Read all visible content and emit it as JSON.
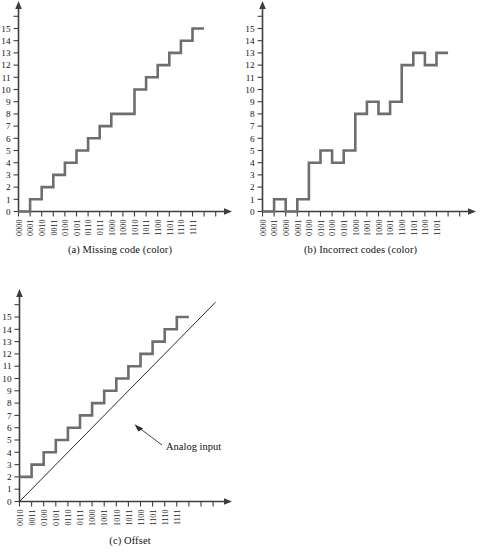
{
  "figure": {
    "title_visible": false,
    "background_color": "#ffffff",
    "stair_color": "#6e6e6e",
    "axis_color": "#3d3d3d",
    "ideal_line_color": "#2b2b2b"
  },
  "panels": [
    {
      "id": "a",
      "caption": "(a) Missing code (color)",
      "y_ticks": [
        "0",
        "1",
        "2",
        "3",
        "4",
        "5",
        "6",
        "7",
        "8",
        "9",
        "10",
        "11",
        "12",
        "13",
        "14",
        "15"
      ],
      "x_ticks": [
        "0000",
        "0001",
        "0010",
        "0011",
        "0100",
        "0101",
        "0110",
        "0111",
        "1000",
        "1000",
        "1010",
        "1011",
        "1100",
        "1101",
        "1110",
        "1111"
      ],
      "values": [
        0,
        1,
        2,
        3,
        4,
        5,
        6,
        7,
        8,
        8,
        10,
        11,
        12,
        13,
        14,
        15
      ]
    },
    {
      "id": "b",
      "caption": "(b) Incorrect codes (color)",
      "y_ticks": [
        "0",
        "1",
        "2",
        "3",
        "4",
        "5",
        "6",
        "7",
        "8",
        "9",
        "10",
        "11",
        "12",
        "13",
        "14",
        "15"
      ],
      "x_ticks": [
        "0000",
        "0001",
        "0000",
        "0001",
        "0100",
        "0101",
        "0100",
        "0101",
        "1000",
        "1001",
        "1000",
        "1001",
        "1100",
        "1101",
        "1100",
        "1101"
      ],
      "values": [
        0,
        1,
        0,
        1,
        4,
        5,
        4,
        5,
        8,
        9,
        8,
        9,
        12,
        13,
        12,
        13
      ]
    },
    {
      "id": "c",
      "caption": "(c) Offset",
      "y_ticks": [
        "0",
        "1",
        "2",
        "3",
        "4",
        "5",
        "6",
        "7",
        "8",
        "9",
        "10",
        "11",
        "12",
        "13",
        "14",
        "15"
      ],
      "x_ticks": [
        "0010",
        "0011",
        "0100",
        "0101",
        "0110",
        "0111",
        "1000",
        "1001",
        "1010",
        "1011",
        "1100",
        "1101",
        "1110",
        "1111"
      ],
      "values": [
        2,
        3,
        4,
        5,
        6,
        7,
        8,
        9,
        10,
        11,
        12,
        13,
        14,
        15
      ],
      "annotation": "Analog input"
    }
  ],
  "chart_data": [
    {
      "type": "line",
      "subtype": "staircase",
      "title": "(a) Missing code (color)",
      "xlabel": "",
      "ylabel": "",
      "categories": [
        "0000",
        "0001",
        "0010",
        "0011",
        "0100",
        "0101",
        "0110",
        "0111",
        "1000",
        "1000",
        "1010",
        "1011",
        "1100",
        "1101",
        "1110",
        "1111"
      ],
      "values": [
        0,
        1,
        2,
        3,
        4,
        5,
        6,
        7,
        8,
        8,
        10,
        11,
        12,
        13,
        14,
        15
      ],
      "ylim": [
        0,
        16
      ],
      "ytick_labels": [
        "0",
        "1",
        "2",
        "3",
        "4",
        "5",
        "6",
        "7",
        "8",
        "9",
        "10",
        "11",
        "12",
        "13",
        "14",
        "15"
      ],
      "grid": false,
      "legend": false,
      "note": "Code 1001 is missing; the step at level 8 spans two input codes and the output jumps from 8 to 10."
    },
    {
      "type": "line",
      "subtype": "staircase",
      "title": "(b) Incorrect codes (color)",
      "xlabel": "",
      "ylabel": "",
      "categories": [
        "0000",
        "0001",
        "0000",
        "0001",
        "0100",
        "0101",
        "0100",
        "0101",
        "1000",
        "1001",
        "1000",
        "1001",
        "1100",
        "1101",
        "1100",
        "1101"
      ],
      "values": [
        0,
        1,
        0,
        1,
        4,
        5,
        4,
        5,
        8,
        9,
        8,
        9,
        12,
        13,
        12,
        13
      ],
      "ylim": [
        0,
        16
      ],
      "ytick_labels": [
        "0",
        "1",
        "2",
        "3",
        "4",
        "5",
        "6",
        "7",
        "8",
        "9",
        "10",
        "11",
        "12",
        "13",
        "14",
        "15"
      ],
      "grid": false,
      "legend": false,
      "note": "Codes repeat in pairs so the transfer curve steps down and back up, producing incorrect output codes."
    },
    {
      "type": "line",
      "subtype": "staircase",
      "title": "(c) Offset",
      "xlabel": "",
      "ylabel": "",
      "categories": [
        "0010",
        "0011",
        "0100",
        "0101",
        "0110",
        "0111",
        "1000",
        "1001",
        "1010",
        "1011",
        "1100",
        "1101",
        "1110",
        "1111"
      ],
      "values": [
        2,
        3,
        4,
        5,
        6,
        7,
        8,
        9,
        10,
        11,
        12,
        13,
        14,
        15
      ],
      "ylim": [
        0,
        16
      ],
      "ytick_labels": [
        "0",
        "1",
        "2",
        "3",
        "4",
        "5",
        "6",
        "7",
        "8",
        "9",
        "10",
        "11",
        "12",
        "13",
        "14",
        "15"
      ],
      "grid": false,
      "legend": false,
      "annotations": [
        {
          "text": "Analog input",
          "refers_to": "ideal straight line through origin"
        }
      ],
      "series": [
        {
          "name": "staircase output",
          "values": [
            2,
            3,
            4,
            5,
            6,
            7,
            8,
            9,
            10,
            11,
            12,
            13,
            14,
            15
          ]
        },
        {
          "name": "Analog input",
          "type": "line",
          "x": [
            0,
            15
          ],
          "y": [
            0,
            15
          ]
        }
      ],
      "note": "The staircase is shifted upward by two LSBs relative to the ideal analog-input line."
    }
  ]
}
